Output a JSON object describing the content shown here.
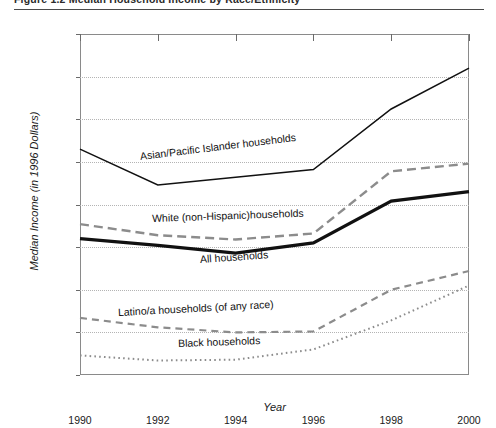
{
  "title": {
    "text": "Figure 1.2    Median Household Income by Race/Ethnicity",
    "visible_fragment": true
  },
  "axes": {
    "y_label": "Median Income (in 1996 Dollars)",
    "x_label": "Year",
    "y_ticks": [
      "$60,000",
      "$55,000",
      "$50,000",
      "$45,000",
      "$40,000",
      "$35,000",
      "$30,000",
      "$25,000",
      "$20,000"
    ],
    "x_ticks": [
      "1990",
      "1992",
      "1994",
      "1996",
      "1998",
      "2000"
    ]
  },
  "annotations": [
    {
      "id": "asian",
      "text": "Asian/Pacific Islander households"
    },
    {
      "id": "white",
      "text": "White (non-Hispanic)households"
    },
    {
      "id": "all",
      "text": "All households"
    },
    {
      "id": "latino",
      "text": "Latino/a households (of any race)"
    },
    {
      "id": "black",
      "text": "Black households"
    }
  ],
  "colors": {
    "axis": "#8a8a8a",
    "grid": "#b4b4b4",
    "series_dark": "#111111",
    "series_gray": "#8c8c8c",
    "background": "#ffffff"
  },
  "chart_data": {
    "type": "line",
    "title": "Median Household Income by Race/Ethnicity",
    "xlabel": "Year",
    "ylabel": "Median Income (in 1996 Dollars)",
    "x": [
      1990,
      1992,
      1994,
      1996,
      1998,
      2000
    ],
    "xlim": [
      1990,
      2000
    ],
    "ylim": [
      20000,
      60000
    ],
    "ytick_step": 5000,
    "grid": true,
    "legend": "inline-annotations",
    "series": [
      {
        "name": "Asian/Pacific Islander households",
        "style": "solid-thin",
        "color": "#111111",
        "values": [
          46500,
          42300,
          43200,
          44100,
          51200,
          56000
        ]
      },
      {
        "name": "White (non-Hispanic)households",
        "style": "dashed",
        "color": "#8c8c8c",
        "values": [
          37700,
          36400,
          35900,
          36600,
          43900,
          44800
        ]
      },
      {
        "name": "All households",
        "style": "solid-thick",
        "color": "#111111",
        "values": [
          36000,
          35200,
          34300,
          35500,
          40400,
          41500
        ]
      },
      {
        "name": "Latino/a households (of any race)",
        "style": "dashed-short",
        "color": "#8c8c8c",
        "values": [
          26700,
          25600,
          25000,
          25100,
          30000,
          32200
        ]
      },
      {
        "name": "Black households",
        "style": "dotted",
        "color": "#8c8c8c",
        "values": [
          22300,
          21700,
          21800,
          23000,
          26400,
          30500
        ]
      }
    ]
  }
}
